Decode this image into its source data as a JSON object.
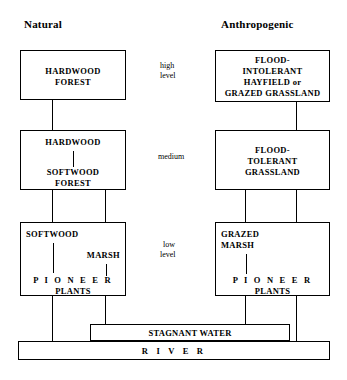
{
  "columns": {
    "left_title": "Natural",
    "right_title": "Anthropogenic"
  },
  "levels": {
    "high": "high\nlevel",
    "high_line1": "high",
    "high_line2": "level",
    "medium": "medium",
    "low_line1": "low",
    "low_line2": "level"
  },
  "natural": {
    "high_box": {
      "line1": "HARDWOOD",
      "line2": "FOREST"
    },
    "medium_box": {
      "line1": "HARDWOOD",
      "line2": "SOFTWOOD",
      "line3": "FOREST"
    },
    "low_box": {
      "softwood": "SOFTWOOD",
      "marsh": "MARSH",
      "pioneer": "P I O N E E R",
      "plants": "PLANTS"
    }
  },
  "anthropogenic": {
    "high_box": {
      "line1": "FLOOD-",
      "line2": "INTOLERANT",
      "line3": "HAYFIELD or",
      "line4": "GRAZED GRASSLAND"
    },
    "medium_box": {
      "line1": "FLOOD-",
      "line2": "TOLERANT",
      "line3": "GRASSLAND"
    },
    "low_box": {
      "line1": "GRAZED",
      "line2": "MARSH",
      "pioneer": "P I O N E E R",
      "plants": "PLANTS"
    }
  },
  "water": {
    "stagnant": "STAGNANT WATER",
    "river": "R I V E R"
  },
  "colors": {
    "stroke": "#000000",
    "background": "#ffffff"
  }
}
